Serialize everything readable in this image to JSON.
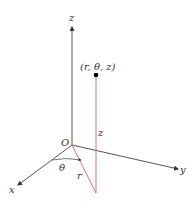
{
  "figure": {
    "type": "cylindrical-coordinates-diagram",
    "labels": {
      "z_axis": "z",
      "x_axis": "x",
      "y_axis": "y",
      "origin": "O",
      "point": "(r, θ, z)",
      "height": "z",
      "radius": "r",
      "angle": "θ"
    },
    "colors": {
      "axis": "#444444",
      "projection": "#e07070",
      "point": "#000000",
      "text": "#333333"
    }
  }
}
